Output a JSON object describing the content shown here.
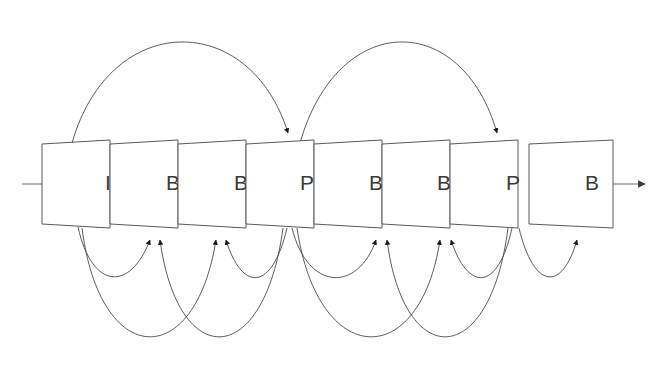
{
  "diagram": {
    "canvas": {
      "width": 667,
      "height": 378,
      "background": "#ffffff"
    },
    "colors": {
      "frame_stroke": "#5a5a5a",
      "frame_fill": "#ffffff",
      "label_text": "#3a3a3a",
      "connector": "#6a6a6a",
      "arc": "#4a4a4a",
      "arrowhead": "#1a1a1a"
    },
    "frames": [
      {
        "label": "I",
        "type": "intra",
        "index": 0,
        "x": 42,
        "cx": 108,
        "label_x": 108
      },
      {
        "label": "B",
        "type": "bidirectional",
        "index": 1,
        "x": 110,
        "cx": 172,
        "label_x": 173
      },
      {
        "label": "B",
        "type": "bidirectional",
        "index": 2,
        "x": 178,
        "cx": 240,
        "label_x": 241
      },
      {
        "label": "P",
        "type": "predicted",
        "index": 3,
        "x": 246,
        "cx": 305,
        "label_x": 307
      },
      {
        "label": "B",
        "type": "bidirectional",
        "index": 4,
        "x": 314,
        "cx": 375,
        "label_x": 376
      },
      {
        "label": "B",
        "type": "bidirectional",
        "index": 5,
        "x": 382,
        "cx": 443,
        "label_x": 444
      },
      {
        "label": "P",
        "type": "predicted",
        "index": 6,
        "x": 450,
        "cx": 512,
        "label_x": 513
      },
      {
        "label": "B",
        "type": "bidirectional",
        "index": 7,
        "x": 529,
        "cx": 592,
        "label_x": 592
      }
    ],
    "frame_geometry": {
      "width": 68,
      "top_y": 140,
      "bottom_y": 228,
      "skew": 10,
      "note": "parallelogram: top edge shifted left of bottom edge"
    },
    "connectors": {
      "input_line": {
        "x1": 22,
        "x2": 90,
        "y": 184
      },
      "output_arrow": {
        "x1": 612,
        "x2": 648,
        "y": 184
      },
      "between_frames_y": 184
    },
    "top_arcs": [
      {
        "from": "I",
        "to": "P",
        "from_x": 72,
        "to_x": 290,
        "peak_y": 26,
        "label": "I to P forward prediction"
      },
      {
        "from": "P",
        "to": "P",
        "from_x": 300,
        "to_x": 500,
        "peak_y": 26,
        "label": "P to P forward prediction"
      }
    ],
    "bottom_arcs": [
      {
        "from": "I",
        "to": "B",
        "from_x": 78,
        "to_x": 152,
        "depth_y": 292,
        "label": "I to B1 reference"
      },
      {
        "from": "I",
        "to": "B",
        "from_x": 82,
        "to_x": 217,
        "depth_y": 348,
        "label": "I to B2 reference"
      },
      {
        "from": "P",
        "to": "B",
        "from_x": 287,
        "to_x": 224,
        "depth_y": 292,
        "label": "P1 to B2 backward reference"
      },
      {
        "from": "P",
        "to": "B",
        "from_x": 283,
        "to_x": 159,
        "depth_y": 348,
        "label": "P1 to B1 backward reference"
      },
      {
        "from": "P",
        "to": "B",
        "from_x": 292,
        "to_x": 378,
        "depth_y": 292,
        "label": "P1 to B3 reference"
      },
      {
        "from": "P",
        "to": "B",
        "from_x": 296,
        "to_x": 441,
        "depth_y": 348,
        "label": "P1 to B4 reference"
      },
      {
        "from": "P",
        "to": "B",
        "from_x": 512,
        "to_x": 449,
        "depth_y": 292,
        "label": "P2 to B4 backward reference"
      },
      {
        "from": "P",
        "to": "B",
        "from_x": 508,
        "to_x": 385,
        "depth_y": 348,
        "label": "P2 to B3 backward reference"
      },
      {
        "from": "P",
        "to": "B",
        "from_x": 519,
        "to_x": 578,
        "depth_y": 288,
        "label": "P2 to B5 reference"
      }
    ]
  }
}
